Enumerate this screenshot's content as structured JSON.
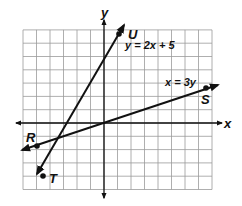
{
  "diagram": {
    "type": "coordinate-plane",
    "grid": {
      "xmin": -6,
      "xmax": 8,
      "ymin": -5,
      "ymax": 7,
      "step": 1
    },
    "axes": {
      "x_label": "x",
      "y_label": "y"
    },
    "lines": [
      {
        "equation": "y = 2x + 5",
        "points": [
          {
            "name": "U",
            "x": 1,
            "y": 7
          },
          {
            "name": "T",
            "x": -4,
            "y": -3
          }
        ]
      },
      {
        "equation": "x = 3y",
        "points": [
          {
            "name": "S",
            "x": 7.5,
            "y": 2.5
          },
          {
            "name": "R",
            "x": -5,
            "y": -1.667
          }
        ]
      }
    ],
    "intersection": {
      "x": -3,
      "y": -1
    }
  },
  "labels": {
    "x_axis": "x",
    "y_axis": "y",
    "line1_eq": "y = 2x + 5",
    "line2_eq": "x = 3y",
    "point_U": "U",
    "point_T": "T",
    "point_S": "S",
    "point_R": "R"
  },
  "colors": {
    "grid": "#9a9a9a",
    "ink": "#111111",
    "background": "#ffffff"
  }
}
